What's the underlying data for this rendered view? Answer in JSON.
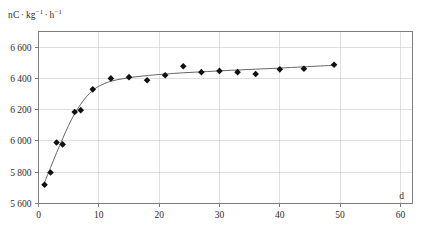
{
  "chart_data": {
    "type": "scatter",
    "title": "",
    "subtitle": "",
    "ylabel_parts": {
      "unit_1": "nC",
      "sep": "·",
      "unit_2": "kg",
      "exp_2": "−1",
      "unit_3": "h",
      "exp_3": "−1"
    },
    "ylabel": "nC · kg⁻¹ · h⁻¹",
    "xlabel": "d",
    "xlim": [
      0,
      62
    ],
    "ylim": [
      5600,
      6700
    ],
    "grid": true,
    "legend": "none",
    "xticks": [
      0,
      10,
      20,
      30,
      40,
      50,
      60
    ],
    "xticklabels": [
      "0",
      "10",
      "20",
      "30",
      "40",
      "50",
      "60"
    ],
    "yticks": [
      5600,
      5800,
      6000,
      6200,
      6400,
      6600
    ],
    "yticklabels": [
      "5 600",
      "5 800",
      "6 000",
      "6 200",
      "6 400",
      "6 600"
    ],
    "x": [
      1,
      2,
      3,
      4,
      6,
      7,
      9,
      12,
      15,
      18,
      21,
      24,
      27,
      30,
      33,
      36,
      40,
      44,
      49
    ],
    "values": [
      5720,
      5798,
      5990,
      5978,
      6185,
      6197,
      6330,
      6400,
      6408,
      6388,
      6420,
      6478,
      6440,
      6448,
      6440,
      6428,
      6458,
      6462,
      6487
    ],
    "series": [
      {
        "name": "measurements",
        "marker": "diamond",
        "color": "#111111",
        "x": [
          1,
          2,
          3,
          4,
          6,
          7,
          9,
          12,
          15,
          18,
          21,
          24,
          27,
          30,
          33,
          36,
          40,
          44,
          49
        ],
        "values": [
          5720,
          5798,
          5990,
          5978,
          6185,
          6197,
          6330,
          6400,
          6408,
          6388,
          6420,
          6478,
          6440,
          6448,
          6440,
          6428,
          6458,
          6462,
          6487
        ]
      },
      {
        "name": "fitted-curve",
        "marker": "none",
        "color": "#666666",
        "x": [
          1,
          2,
          3,
          4,
          5,
          6,
          7,
          8,
          9,
          10,
          12,
          14,
          16,
          18,
          20,
          24,
          28,
          32,
          36,
          40,
          44,
          49
        ],
        "values": [
          5735,
          5830,
          5925,
          6015,
          6100,
          6175,
          6235,
          6285,
          6322,
          6350,
          6382,
          6398,
          6410,
          6418,
          6425,
          6436,
          6444,
          6452,
          6459,
          6466,
          6474,
          6484
        ]
      }
    ]
  },
  "axis_colors": {
    "grid": "#c9c9c9",
    "frame": "#7d7d7d",
    "marker": "#111111",
    "curve": "#666666",
    "text": "#2b2b2b"
  }
}
